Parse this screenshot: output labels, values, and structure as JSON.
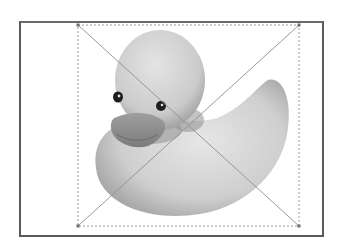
{
  "document": {
    "image_subject": "rubber duck",
    "image_mode": "grayscale"
  },
  "selection": {
    "style": "dashed bounding box with diagonal cross",
    "handles": [
      "top-left",
      "top-right",
      "bottom-left",
      "bottom-right"
    ],
    "line_color": "#8a8a8a",
    "handle_color": "#6e6e6e"
  },
  "colors": {
    "frame_border": "#5a5a5a",
    "background": "#ffffff"
  }
}
